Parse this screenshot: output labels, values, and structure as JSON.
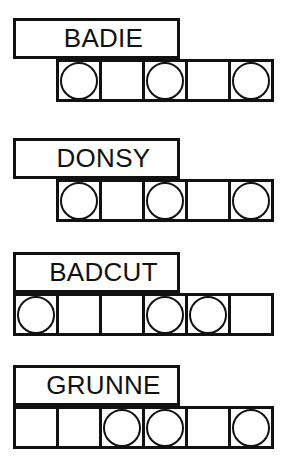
{
  "sheet": {
    "title": "word puzzle answer grid sheet",
    "background_color": "#ffffff",
    "ink_color": "#111111"
  },
  "groups": [
    {
      "id": "group-badie",
      "label": "BADIE",
      "top": 18,
      "grid_offset": "indent",
      "cell_count": 5,
      "circles": [
        true,
        false,
        true,
        false,
        true
      ]
    },
    {
      "id": "group-donsy",
      "label": "DONSY",
      "top": 138,
      "grid_offset": "indent",
      "cell_count": 5,
      "circles": [
        true,
        false,
        true,
        false,
        true
      ]
    },
    {
      "id": "group-badcut",
      "label": "BADCUT",
      "top": 252,
      "grid_offset": "flush",
      "cell_count": 6,
      "circles": [
        true,
        false,
        false,
        true,
        true,
        false
      ]
    },
    {
      "id": "group-grunne",
      "label": "GRUNNE",
      "top": 365,
      "grid_offset": "flush",
      "cell_count": 6,
      "circles": [
        false,
        false,
        true,
        true,
        false,
        true
      ]
    }
  ]
}
